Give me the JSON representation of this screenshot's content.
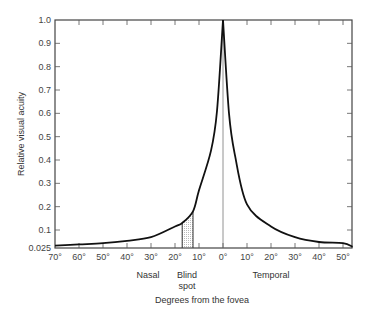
{
  "chart_data": {
    "type": "line",
    "title": "",
    "xlabel": "Degrees from the fovea",
    "ylabel": "Relative visual acuity",
    "x_region_labels": [
      "Nasal",
      "Blind spot",
      "Temporal"
    ],
    "x_tick_labels": [
      "70°",
      "60°",
      "50°",
      "40°",
      "30°",
      "20°",
      "10°",
      "0°",
      "10°",
      "20°",
      "30°",
      "40°",
      "50°"
    ],
    "y_tick_labels": [
      "0.025",
      "0.1",
      "0.2",
      "0.3",
      "0.4",
      "0.5",
      "0.6",
      "0.7",
      "0.8",
      "0.9",
      "1.0"
    ],
    "xlim": [
      -70,
      54
    ],
    "ylim": [
      0.025,
      1.0
    ],
    "grid": false,
    "legend": null,
    "annotations": [
      {
        "type": "shaded-band",
        "label": "Blind spot",
        "x_from": -17,
        "x_to": -12.5
      },
      {
        "type": "vertical-line",
        "x": 0
      }
    ],
    "series": [
      {
        "name": "Relative visual acuity",
        "x": [
          -70,
          -60,
          -50,
          -40,
          -30,
          -20,
          -17,
          -12.5,
          -10,
          -5,
          -2.5,
          0,
          2.5,
          5,
          10,
          20,
          30,
          40,
          50,
          54
        ],
        "values": [
          0.035,
          0.04,
          0.045,
          0.055,
          0.07,
          0.115,
          0.13,
          0.18,
          0.27,
          0.44,
          0.61,
          1.0,
          0.6,
          0.42,
          0.21,
          0.115,
          0.07,
          0.05,
          0.045,
          0.03
        ]
      }
    ]
  }
}
